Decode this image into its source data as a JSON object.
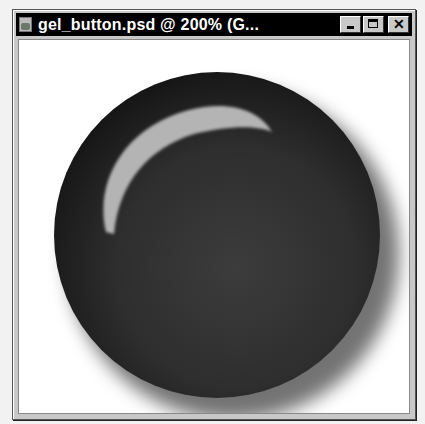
{
  "window": {
    "title": "gel_button.psd @ 200% (G...",
    "icon": "photoshop-document-icon",
    "controls": {
      "minimize_label": "",
      "maximize_label": "",
      "close_label": "✕"
    }
  },
  "canvas": {
    "background": "#ffffff",
    "artwork": "black glossy gel button with crescent highlight and drop shadow"
  },
  "colors": {
    "titlebar": "#000000",
    "frame": "#c8c8c8",
    "button_body": "#2e2e2e",
    "highlight": "#b4b4b4"
  }
}
